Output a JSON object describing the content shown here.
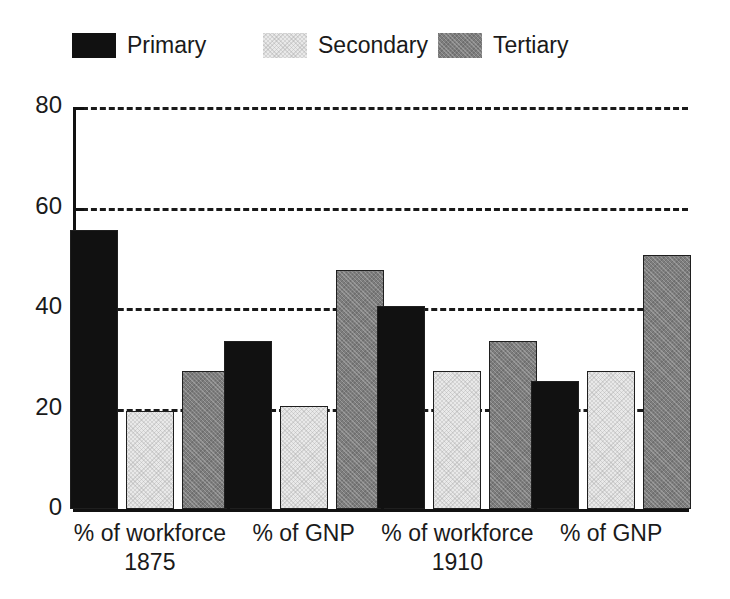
{
  "chart_data": {
    "type": "bar",
    "title": "",
    "subtitle": "",
    "xlabel": "",
    "ylabel": "",
    "ylim": [
      0,
      80
    ],
    "yticks": [
      0,
      20,
      40,
      60,
      80
    ],
    "ytick_labels": [
      "0",
      "20",
      "40",
      "60",
      "80"
    ],
    "grid": true,
    "grid_axis": "y",
    "grid_style": "dashed",
    "legend_position": "top",
    "categories": [
      "% of workforce",
      "% of GNP",
      "% of workforce",
      "% of GNP"
    ],
    "category_sublabels": [
      "1875",
      "",
      "1910",
      ""
    ],
    "group_periods": [
      "1875",
      "1875",
      "1910",
      "1910"
    ],
    "series": [
      {
        "name": "Primary",
        "color": "#111111",
        "values": [
          55.5,
          33.5,
          40.5,
          25.5
        ]
      },
      {
        "name": "Secondary",
        "color": "#e9e9e9",
        "values": [
          19.5,
          20.5,
          27.5,
          27.5
        ]
      },
      {
        "name": "Tertiary",
        "color": "#7d7d7d",
        "values": [
          27.5,
          47.5,
          33.5,
          50.5
        ]
      }
    ]
  },
  "legend": {
    "items": [
      {
        "label": "Primary",
        "swatch": "primary"
      },
      {
        "label": "Secondary",
        "swatch": "secondary"
      },
      {
        "label": "Tertiary",
        "swatch": "tertiary"
      }
    ]
  },
  "axes": {
    "y_tick_labels": [
      "80",
      "60",
      "40",
      "20",
      "0"
    ],
    "x_group_labels": [
      {
        "line1": "% of workforce",
        "line2": "1875"
      },
      {
        "line1": "% of GNP",
        "line2": ""
      },
      {
        "line1": "% of workforce",
        "line2": "1910"
      },
      {
        "line1": "% of GNP",
        "line2": ""
      }
    ]
  },
  "colors": {
    "primary": "#111111",
    "secondary": "#e9e9e9",
    "tertiary": "#7d7d7d",
    "axis": "#111111",
    "grid": "#1a1a1a",
    "background": "#ffffff",
    "text": "#1a1a1a"
  }
}
